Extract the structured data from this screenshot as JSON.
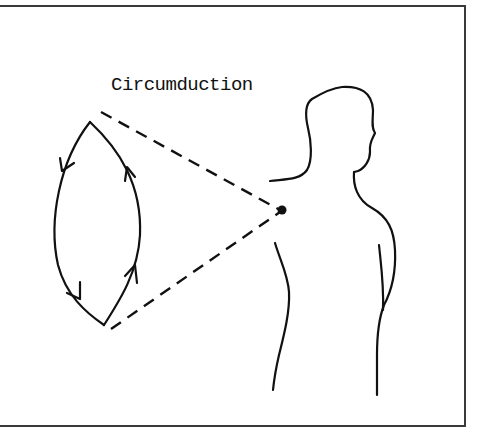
{
  "figure": {
    "title": "Circumduction",
    "elements": {
      "motion_path": "lens-shaped loop traced by the arm",
      "direction_arrows": [
        "left-upper-arrow-down",
        "left-lower-arrow-down",
        "right-lower-arrow-up",
        "right-upper-arrow-up"
      ],
      "pivot": "shoulder joint point",
      "cone_lines": [
        "upper-dashed-line",
        "lower-dashed-line"
      ],
      "figure": "human upper-body outline (side view)"
    },
    "colors": {
      "ink": "#111111",
      "frame": "#3a3a3a",
      "background": "#ffffff"
    }
  }
}
